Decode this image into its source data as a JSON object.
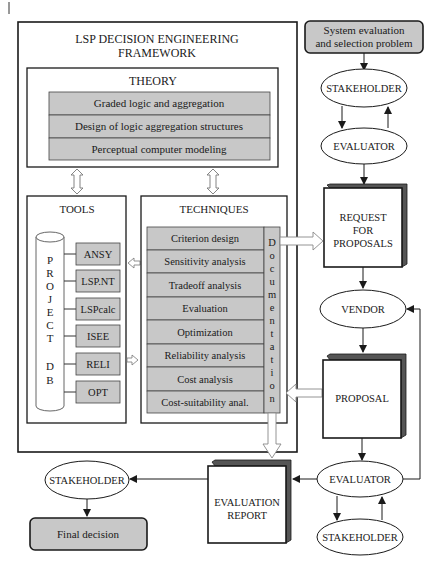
{
  "framework": {
    "title_line1": "LSP DECISION ENGINEERING",
    "title_line2": "FRAMEWORK"
  },
  "theory": {
    "title": "THEORY",
    "items": [
      "Graded logic and aggregation",
      "Design of logic aggregation structures",
      "Perceptual computer modeling"
    ]
  },
  "tools": {
    "title": "TOOLS",
    "database_letters": [
      "P",
      "R",
      "O",
      "J",
      "E",
      "C",
      "T",
      "",
      "D",
      "B"
    ],
    "database_label": "PROJECT DB",
    "items": [
      "ANSY",
      "LSP.NT",
      "LSPcalc",
      "ISEE",
      "RELI",
      "OPT"
    ]
  },
  "techniques": {
    "title": "TECHNIQUES",
    "items": [
      "Criterion design",
      "Sensitivity analysis",
      "Tradeoff analysis",
      "Evaluation",
      "Optimization",
      "Reliability analysis",
      "Cost analysis",
      "Cost-suitability anal."
    ],
    "documentation_letters": [
      "D",
      "o",
      "c",
      "u",
      "m",
      "e",
      "n",
      "t",
      "a",
      "t",
      "i",
      "o",
      "n"
    ],
    "documentation_label": "Documentation"
  },
  "process": {
    "start_line1": "System evaluation",
    "start_line2": "and selection problem",
    "stakeholder_top": "STAKEHOLDER",
    "evaluator_top": "EVALUATOR",
    "rfp_line1": "REQUEST",
    "rfp_line2": "FOR",
    "rfp_line3": "PROPOSALS",
    "vendor": "VENDOR",
    "proposal": "PROPOSAL",
    "evaluator_bottom": "EVALUATOR",
    "stakeholder_bottom": "STAKEHOLDER",
    "report_line1": "EVALUATION",
    "report_line2": "REPORT",
    "stakeholder_final": "STAKEHOLDER",
    "final_decision": "Final decision"
  },
  "colors": {
    "gray_fill": "#c8c8c8",
    "stroke": "#1a1a1a",
    "shadow": "#5a5a5a"
  }
}
